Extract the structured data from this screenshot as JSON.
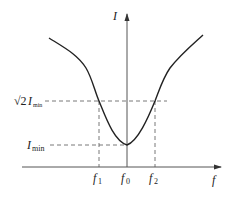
{
  "diagram": {
    "type": "resonance-curve",
    "axes": {
      "y_label": "I",
      "x_label": "f"
    },
    "levels": {
      "upper": {
        "prefix": "√2",
        "symbol": "I",
        "subscript": "min"
      },
      "lower": {
        "symbol": "I",
        "subscript": "min"
      }
    },
    "x_ticks": [
      {
        "symbol": "f",
        "subscript": "1"
      },
      {
        "symbol": "f",
        "subscript": "0"
      },
      {
        "symbol": "f",
        "subscript": "2"
      }
    ],
    "colors": {
      "curve": "#222222",
      "axis": "#555555",
      "dashed": "#555555"
    }
  }
}
